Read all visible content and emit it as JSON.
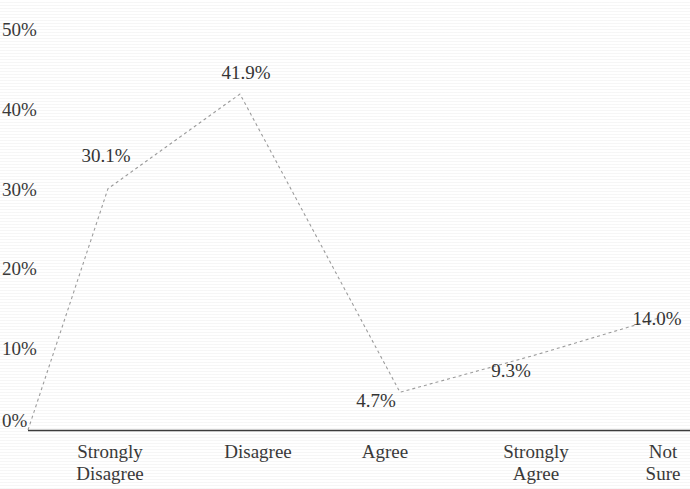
{
  "chart_data": {
    "type": "line",
    "title": "",
    "subtitle": "",
    "xlabel": "",
    "ylabel": "",
    "categories": [
      "Strongly\nDisagree",
      "Disagree",
      "Agree",
      "Strongly\nAgree",
      "Not\nSure"
    ],
    "category_labels_flat": [
      "Strongly Disagree",
      "Disagree",
      "Agree",
      "Strongly Agree",
      "Not Sure"
    ],
    "values": [
      30.1,
      41.9,
      4.7,
      9.3,
      14.0
    ],
    "point_labels": [
      "30.1%",
      "41.9%",
      "4.7%",
      "9.3%",
      "14.0%"
    ],
    "ylim": [
      0,
      50
    ],
    "yticks": [
      0,
      10,
      20,
      30,
      40,
      50
    ],
    "ytick_labels": [
      "0%",
      "10%",
      "20%",
      "30%",
      "40%",
      "50%"
    ],
    "grid": false,
    "legend": "none",
    "series": [
      {
        "name": "Response distribution",
        "values": [
          30.1,
          41.9,
          4.7,
          9.3,
          14.0
        ],
        "line_style": "dashed",
        "line_color": "#9a9a9a",
        "markers": false
      }
    ],
    "axis_color": "#4a4a4a",
    "text_color": "#3a3a3a",
    "background_color": "#ffffff"
  }
}
